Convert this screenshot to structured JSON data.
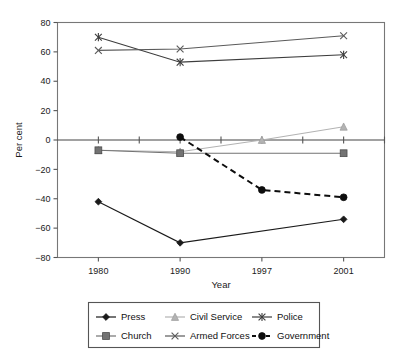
{
  "chart_data": {
    "type": "line",
    "title": "",
    "xlabel": "Year",
    "ylabel": "Per cent",
    "categories": [
      "1980",
      "1990",
      "1997",
      "2001"
    ],
    "ylim": [
      -80,
      80
    ],
    "yticks": [
      80,
      60,
      40,
      20,
      0,
      -20,
      -40,
      -60,
      -80
    ],
    "ytick_labels": [
      "80",
      "60",
      "40",
      "20",
      "0",
      "−20",
      "−40",
      "−60",
      "−80"
    ],
    "grid": false,
    "legend_position": "bottom",
    "series": [
      {
        "name": "Press",
        "marker": "diamond",
        "color": "#1a1a1a",
        "dash": "solid",
        "x": [
          "1980",
          "1990",
          "2001"
        ],
        "values": [
          -42,
          -70,
          -54
        ]
      },
      {
        "name": "Civil Service",
        "marker": "triangle",
        "color": "#b3b3b3",
        "dash": "solid",
        "x": [
          "1980",
          "1990",
          "1997",
          "2001"
        ],
        "values": [
          -7,
          -8,
          0,
          9
        ]
      },
      {
        "name": "Police",
        "marker": "asterisk",
        "color": "#3d3d3d",
        "dash": "solid",
        "x": [
          "1980",
          "1990",
          "2001"
        ],
        "values": [
          70,
          53,
          58
        ]
      },
      {
        "name": "Church",
        "marker": "square",
        "color": "#737373",
        "dash": "solid",
        "x": [
          "1980",
          "1990",
          "2001"
        ],
        "values": [
          -7,
          -9,
          -9
        ]
      },
      {
        "name": "Armed Forces",
        "marker": "cross",
        "color": "#5a5a5a",
        "dash": "solid",
        "x": [
          "1980",
          "1990",
          "2001"
        ],
        "values": [
          61,
          62,
          71
        ]
      },
      {
        "name": "Government",
        "marker": "circle",
        "color": "#0d0d0d",
        "dash": "dashed",
        "x": [
          "1990",
          "1997",
          "2001"
        ],
        "values": [
          2,
          -34,
          -39
        ]
      }
    ]
  },
  "legend": {
    "rows": [
      [
        "Press",
        "Civil Service",
        "Police"
      ],
      [
        "Church",
        "Armed Forces",
        "Government"
      ]
    ]
  }
}
